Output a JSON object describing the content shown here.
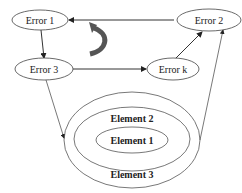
{
  "diagram": {
    "nodes": {
      "error1": "Error 1",
      "error2": "Error 2",
      "error3": "Error 3",
      "errork": "Error k",
      "element1": "Element 1",
      "element2": "Element 2",
      "element3": "Element 3"
    },
    "edges": [
      {
        "from": "Error 2",
        "to": "Error 1"
      },
      {
        "from": "Error 1",
        "to": "Error 3"
      },
      {
        "from": "Error 3",
        "to": "Error k"
      },
      {
        "from": "Error k",
        "to": "Error 2"
      },
      {
        "from": "Error 3",
        "to": "Element 3"
      },
      {
        "from": "Element 3",
        "to": "Error 2"
      }
    ],
    "cycle_arrow_color": "#555555"
  }
}
